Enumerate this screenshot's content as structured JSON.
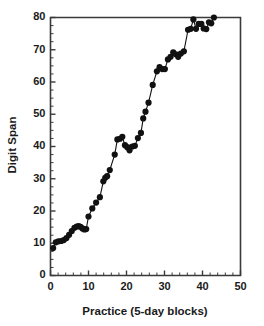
{
  "chart_data": {
    "type": "line",
    "title": "",
    "xlabel": "Practice (5-day blocks)",
    "ylabel": "Digit Span",
    "xlim": [
      0,
      50
    ],
    "ylim": [
      0,
      80
    ],
    "xticks": [
      0,
      10,
      20,
      30,
      40,
      50
    ],
    "yticks": [
      0,
      10,
      20,
      30,
      40,
      50,
      60,
      70,
      80
    ],
    "x_minor_step": 2,
    "y_minor_step": 2.5,
    "grid": false,
    "legend": null,
    "marker": "filled-circle",
    "series": [
      {
        "name": "Digit Span",
        "color": "#111111",
        "points": [
          [
            0.7,
            8.5
          ],
          [
            1.4,
            10.3
          ],
          [
            2.1,
            10.6
          ],
          [
            2.8,
            10.7
          ],
          [
            3.5,
            11.0
          ],
          [
            4.2,
            11.6
          ],
          [
            4.9,
            12.6
          ],
          [
            5.6,
            13.8
          ],
          [
            6.3,
            14.8
          ],
          [
            6.9,
            15.2
          ],
          [
            7.4,
            15.3
          ],
          [
            7.9,
            15.1
          ],
          [
            8.4,
            14.6
          ],
          [
            8.9,
            14.3
          ],
          [
            9.4,
            14.4
          ],
          [
            10.0,
            18.3
          ],
          [
            11.0,
            20.8
          ],
          [
            12.0,
            22.6
          ],
          [
            13.0,
            24.3
          ],
          [
            13.9,
            29.2
          ],
          [
            14.4,
            30.3
          ],
          [
            14.9,
            30.8
          ],
          [
            15.6,
            32.7
          ],
          [
            16.9,
            37.5
          ],
          [
            17.6,
            42.2
          ],
          [
            18.3,
            42.4
          ],
          [
            18.9,
            43.0
          ],
          [
            19.6,
            40.4
          ],
          [
            20.2,
            39.8
          ],
          [
            20.8,
            38.8
          ],
          [
            21.5,
            40.0
          ],
          [
            22.2,
            40.2
          ],
          [
            23.0,
            42.6
          ],
          [
            23.8,
            44.2
          ],
          [
            24.4,
            48.7
          ],
          [
            25.0,
            50.8
          ],
          [
            25.8,
            53.6
          ],
          [
            26.9,
            59.1
          ],
          [
            28.0,
            63.3
          ],
          [
            28.7,
            64.6
          ],
          [
            29.4,
            64.0
          ],
          [
            30.1,
            64.0
          ],
          [
            30.9,
            67.0
          ],
          [
            31.6,
            67.8
          ],
          [
            32.3,
            69.2
          ],
          [
            33.0,
            68.6
          ],
          [
            33.6,
            67.8
          ],
          [
            34.3,
            68.8
          ],
          [
            35.1,
            69.5
          ],
          [
            36.2,
            76.2
          ],
          [
            36.9,
            76.5
          ],
          [
            37.6,
            79.4
          ],
          [
            38.3,
            76.5
          ],
          [
            39.0,
            78.0
          ],
          [
            39.7,
            78.0
          ],
          [
            40.3,
            76.6
          ],
          [
            41.0,
            76.4
          ],
          [
            41.7,
            78.5
          ],
          [
            42.3,
            78.2
          ],
          [
            43.0,
            80.0
          ]
        ]
      }
    ]
  },
  "axes": {
    "x_title": "Practice (5-day blocks)",
    "y_title": "Digit Span",
    "x_tick_labels": [
      "0",
      "10",
      "20",
      "30",
      "40",
      "50"
    ],
    "y_tick_labels": [
      "0",
      "10",
      "20",
      "30",
      "40",
      "50",
      "60",
      "70",
      "80"
    ]
  },
  "colors": {
    "axis": "#3a3a3a",
    "text": "#1a1a1a",
    "series": "#111111",
    "background": "#ffffff"
  }
}
